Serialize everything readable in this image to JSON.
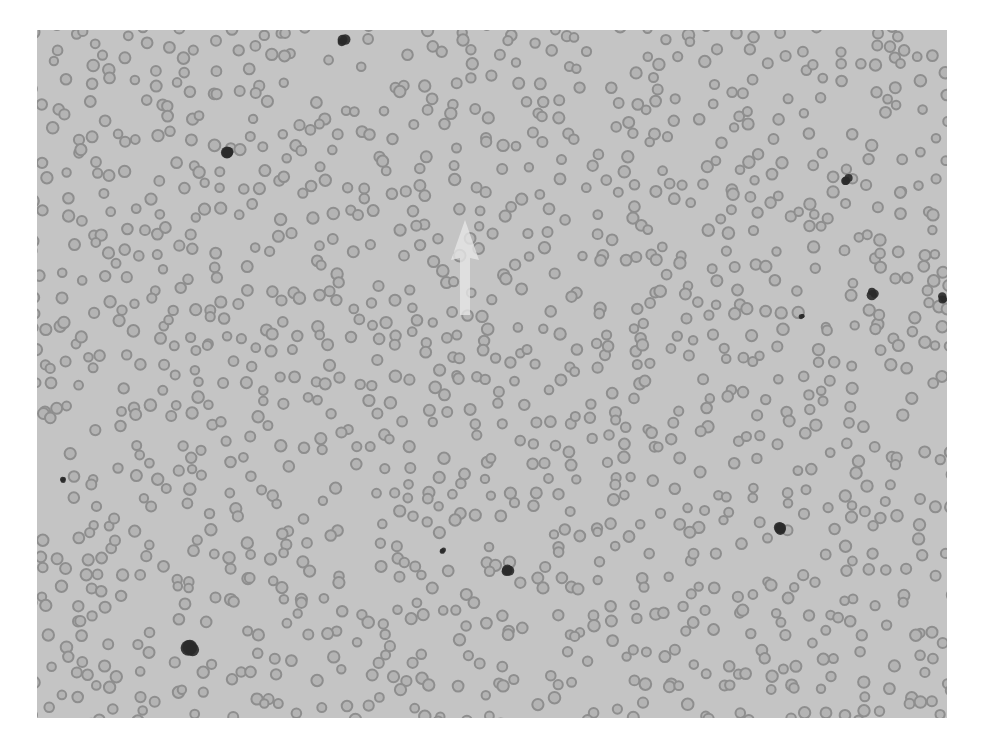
{
  "image": {
    "description": "Grayscale light-microscopy blood smear showing numerous red blood cells with a faint white arrow annotation",
    "background_color": "#c4c4c4",
    "cell_color": "#8e8e8e",
    "cell_center_color": "#b4b4b4",
    "dark_cell_color": "#2a2a2a",
    "arrow_color": "#e6e6e6"
  },
  "annotations": {
    "arrow": {
      "x": 465,
      "y": 270,
      "direction": "up"
    }
  },
  "dark_cells": [
    {
      "x": 343,
      "y": 40,
      "r": 6
    },
    {
      "x": 230,
      "y": 150,
      "r": 8
    },
    {
      "x": 847,
      "y": 180,
      "r": 5
    },
    {
      "x": 873,
      "y": 293,
      "r": 6
    },
    {
      "x": 944,
      "y": 298,
      "r": 5
    },
    {
      "x": 778,
      "y": 527,
      "r": 7
    },
    {
      "x": 508,
      "y": 571,
      "r": 7
    },
    {
      "x": 190,
      "y": 647,
      "r": 9
    },
    {
      "x": 443,
      "y": 551,
      "r": 3
    },
    {
      "x": 63,
      "y": 480,
      "r": 3
    },
    {
      "x": 802,
      "y": 316,
      "r": 3
    }
  ]
}
